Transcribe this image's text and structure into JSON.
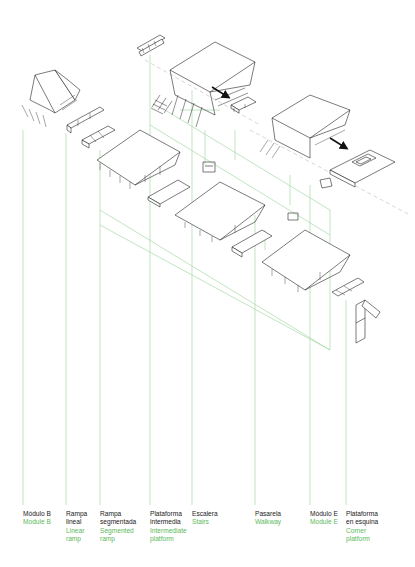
{
  "diagram": {
    "type": "exploded-axonometric",
    "line_colors": {
      "drawing": "#222222",
      "leader": "#9fd49f",
      "arrow": "#111111"
    },
    "label_colors": {
      "spanish": "#1a1a1a",
      "english": "#5cb85c"
    }
  },
  "components": [
    {
      "id": "modulo-b",
      "x": 23,
      "es": [
        "Módulo B"
      ],
      "en": [
        "Module B"
      ]
    },
    {
      "id": "rampa-lineal",
      "x": 66,
      "es": [
        "Rampa",
        "lineal"
      ],
      "en": [
        "Linear",
        "ramp"
      ]
    },
    {
      "id": "rampa-segmentada",
      "x": 100,
      "es": [
        "Rampa",
        "segmentada"
      ],
      "en": [
        "Segmented",
        "ramp"
      ]
    },
    {
      "id": "plataforma-intermedia",
      "x": 150,
      "es": [
        "Plataforma",
        "intermedia"
      ],
      "en": [
        "Intermediate",
        "platform"
      ]
    },
    {
      "id": "escalera",
      "x": 192,
      "es": [
        "Escalera"
      ],
      "en": [
        "Stairs"
      ]
    },
    {
      "id": "pasarela",
      "x": 255,
      "es": [
        "Pasarela"
      ],
      "en": [
        "Walkway"
      ]
    },
    {
      "id": "modulo-e",
      "x": 310,
      "es": [
        "Módulo E"
      ],
      "en": [
        "Module E"
      ]
    },
    {
      "id": "plataforma-esquina",
      "x": 346,
      "es": [
        "Plataforma",
        "en esquina"
      ],
      "en": [
        "Corner",
        "platform"
      ]
    }
  ],
  "labels": {
    "modulo_b": {
      "es1": "Módulo B",
      "en1": "Module B"
    },
    "rampa_lineal": {
      "es1": "Rampa",
      "es2": "lineal",
      "en1": "Linear",
      "en2": "ramp"
    },
    "rampa_segmentada": {
      "es1": "Rampa",
      "es2": "segmentada",
      "en1": "Segmented",
      "en2": "ramp"
    },
    "plataforma_intermedia": {
      "es1": "Plataforma",
      "es2": "intermedia",
      "en1": "Intermediate",
      "en2": "platform"
    },
    "escalera": {
      "es1": "Escalera",
      "en1": "Stairs"
    },
    "pasarela": {
      "es1": "Pasarela",
      "en1": "Walkway"
    },
    "modulo_e": {
      "es1": "Módulo E",
      "en1": "Module E"
    },
    "plataforma_esquina": {
      "es1": "Plataforma",
      "es2": "en esquina",
      "en1": "Corner",
      "en2": "platform"
    }
  }
}
